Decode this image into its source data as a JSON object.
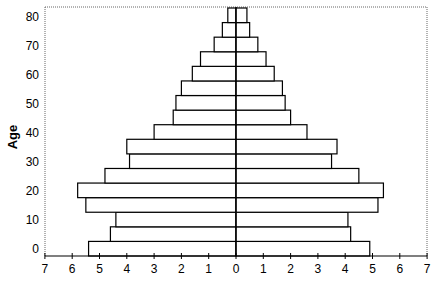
{
  "chart_data": {
    "type": "bar",
    "subtype": "population-pyramid",
    "title": "",
    "xlabel": "",
    "ylabel": "Age",
    "orientation": "horizontal",
    "categories": [
      "0-4",
      "5-9",
      "10-14",
      "15-19",
      "20-24",
      "25-29",
      "30-34",
      "35-39",
      "40-44",
      "45-49",
      "50-54",
      "55-59",
      "60-64",
      "65-69",
      "70-74",
      "75-79",
      "80+"
    ],
    "series": [
      {
        "name": "Left",
        "side": "left",
        "values": [
          5.4,
          4.6,
          4.4,
          5.5,
          5.8,
          4.8,
          3.9,
          4.0,
          3.0,
          2.3,
          2.2,
          2.0,
          1.6,
          1.3,
          0.8,
          0.5,
          0.3
        ]
      },
      {
        "name": "Right",
        "side": "right",
        "values": [
          4.9,
          4.2,
          4.1,
          5.2,
          5.4,
          4.5,
          3.5,
          3.7,
          2.6,
          2.0,
          1.8,
          1.7,
          1.4,
          1.1,
          0.8,
          0.5,
          0.4
        ]
      }
    ],
    "x_ticks": [
      "7",
      "6",
      "5",
      "4",
      "3",
      "2",
      "1",
      "0",
      "1",
      "2",
      "3",
      "4",
      "5",
      "6",
      "7"
    ],
    "y_ticks": [
      "0",
      "10",
      "20",
      "30",
      "40",
      "50",
      "60",
      "70",
      "80"
    ],
    "xlim": [
      -7,
      7
    ],
    "ylim": [
      0,
      85
    ],
    "grid": false,
    "legend": null,
    "colors": {
      "bar_fill": "#ffffff",
      "bar_stroke": "#000000",
      "axis": "#000000",
      "border": "#666666"
    }
  }
}
